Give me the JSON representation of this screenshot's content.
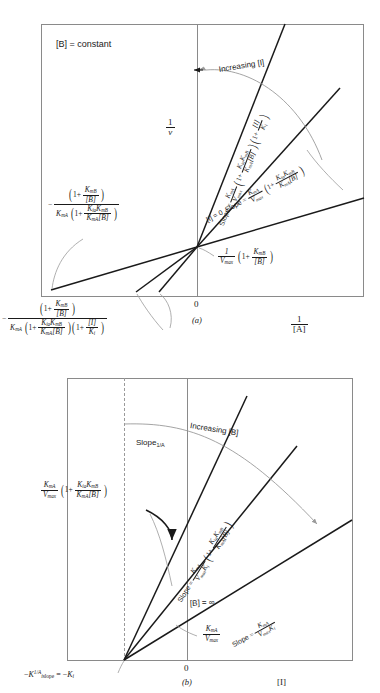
{
  "figure": {
    "type": "two-panel enzyme-kinetics plot",
    "panels": [
      "a",
      "b"
    ]
  },
  "panel_a": {
    "caption": "(a)",
    "condition_note": "[B] = constant",
    "y_axis": {
      "num": "1",
      "den": "v"
    },
    "x_axis": {
      "num": "1",
      "den": "[A]"
    },
    "origin_label": "0",
    "arrow_label": "Increasing [I]",
    "zero_inhibitor_label": "[I] = 0",
    "slope_word": "Slope",
    "equals": "=",
    "slope_inhibited": {
      "lead_num": "K",
      "lead_sub": "mA",
      "lead_den": "V",
      "lead_den_sub": "max",
      "group1_num_a": "K",
      "group1_num_a_sub": "ia",
      "group1_num_b": "K",
      "group1_num_b_sub": "mB",
      "group1_den_a": "K",
      "group1_den_a_sub": "mA",
      "group1_den_b": "[B]",
      "group2_num": "[I]",
      "group2_den": "K",
      "group2_den_sub": "i"
    },
    "slope_uninhibited": {
      "lead_num": "K",
      "lead_sub": "mA",
      "lead_den": "V",
      "lead_den_sub": "max",
      "group_num_a": "K",
      "group_num_a_sub": "ia",
      "group_num_b": "K",
      "group_num_b_sub": "mB",
      "group_den_a": "K",
      "group_den_a_sub": "mA",
      "group_den_b": "[B]"
    },
    "y_intercept": {
      "lead_num": "1",
      "lead_den": "V",
      "lead_den_sub": "max",
      "group_num": "K",
      "group_num_sub": "mB",
      "group_den": "[B]"
    },
    "x_intercept_uninhibited": {
      "minus": "−",
      "num_group_a": "1",
      "num_group_b": "K",
      "num_group_b_sub": "mB",
      "num_group_c": "[B]",
      "den_lead": "K",
      "den_lead_sub": "mA",
      "den_group_num_a": "K",
      "den_group_num_a_sub": "ia",
      "den_group_num_b": "K",
      "den_group_num_b_sub": "mB",
      "den_group_den_a": "K",
      "den_group_den_a_sub": "mA",
      "den_group_den_b": "[B]"
    },
    "x_intercept_inhibited": {
      "minus": "−",
      "num_group_b": "K",
      "num_group_b_sub": "mB",
      "num_group_c": "[B]",
      "den_lead": "K",
      "den_lead_sub": "mA",
      "den_group1_num_a": "K",
      "den_group1_num_a_sub": "ia",
      "den_group1_num_b": "K",
      "den_group1_num_b_sub": "mB",
      "den_group1_den_a": "K",
      "den_group1_den_a_sub": "mA",
      "den_group1_den_b": "[B]",
      "den_group2_num": "[I]",
      "den_group2_den": "K",
      "den_group2_den_sub": "i"
    }
  },
  "panel_b": {
    "caption": "(b)",
    "y_axis_label": "Slope",
    "y_axis_label_sub": "1/A",
    "x_axis_label": "[I]",
    "origin_label": "0",
    "arrow_label": "Increasing [B]",
    "saturating_label": "[B] = ∞",
    "slope_word": "Slope",
    "equals": "=",
    "y_intercept": {
      "lead_num": "K",
      "lead_num_sub": "mA",
      "lead_den": "V",
      "lead_den_sub": "max",
      "group_num_a": "K",
      "group_num_a_sub": "ia",
      "group_num_b": "K",
      "group_num_b_sub": "mB",
      "group_den_a": "K",
      "group_den_a_sub": "mA",
      "group_den_b": "[B]"
    },
    "slope_upper": {
      "lead_num": "K",
      "lead_num_sub": "mA",
      "lead_den_a": "V",
      "lead_den_a_sub": "max",
      "lead_den_b": "K",
      "lead_den_b_sub": "i",
      "group_num_a": "K",
      "group_num_a_sub": "ia",
      "group_num_b": "K",
      "group_num_b_sub": "mB",
      "group_den_a": "K",
      "group_den_a_sub": "mA",
      "group_den_b": "[B]"
    },
    "slope_lower": {
      "lead_num": "K",
      "lead_num_sub": "mA",
      "lead_den_a": "V",
      "lead_den_a_sub": "max",
      "lead_den_b": "K",
      "lead_den_b_sub": "i"
    },
    "limit_intercept": {
      "num": "K",
      "num_sub": "mA",
      "den": "V",
      "den_sub": "max"
    },
    "x_intercept": {
      "minus1": "−",
      "k": "K",
      "k_sub": "i",
      "k_sup": "1/A",
      "k_sub2": "slope",
      "equals": "=",
      "minus2": "−",
      "k2": "K",
      "k2_sub": "i"
    }
  },
  "colors": {
    "line": "#1a1a1a",
    "frame": "#8a8a8a",
    "arrow": "#9a9a9a",
    "background": "#ffffff"
  }
}
